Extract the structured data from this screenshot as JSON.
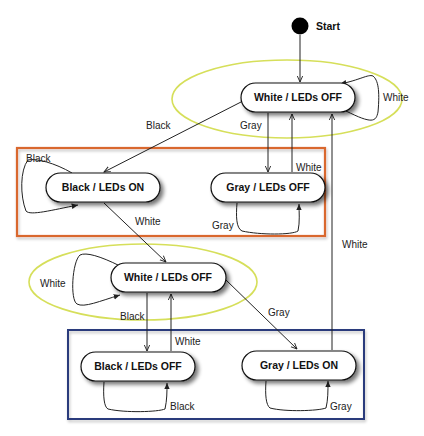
{
  "diagram": {
    "type": "state-machine",
    "start": {
      "label": "Start"
    },
    "groups": {
      "top_ellipse": {
        "color": "#d6df5a"
      },
      "orange_box": {
        "color": "#d9682f"
      },
      "middle_ellipse": {
        "color": "#d6df5a"
      },
      "blue_box": {
        "color": "#2b3a7c"
      }
    },
    "states": [
      {
        "id": "s1",
        "label": "White /  LEDs OFF"
      },
      {
        "id": "s2",
        "label": "Black /  LEDs ON"
      },
      {
        "id": "s3",
        "label": "Gray /  LEDs OFF"
      },
      {
        "id": "s4",
        "label": "White /  LEDs OFF"
      },
      {
        "id": "s5",
        "label": "Black /  LEDs OFF"
      },
      {
        "id": "s6",
        "label": "Gray /  LEDs ON"
      }
    ],
    "transitions": [
      {
        "from": "start",
        "to": "s1",
        "label": ""
      },
      {
        "from": "s1",
        "to": "s1",
        "label": "White"
      },
      {
        "from": "s1",
        "to": "s2",
        "label": "Black"
      },
      {
        "from": "s1",
        "to": "s3",
        "label": "Gray"
      },
      {
        "from": "s3",
        "to": "s1",
        "label": "White"
      },
      {
        "from": "s2",
        "to": "s2",
        "label": "Black"
      },
      {
        "from": "s3",
        "to": "s3",
        "label": "Gray"
      },
      {
        "from": "s2",
        "to": "s4",
        "label": "White"
      },
      {
        "from": "s4",
        "to": "s4",
        "label": "White"
      },
      {
        "from": "s4",
        "to": "s5",
        "label": "Black"
      },
      {
        "from": "s5",
        "to": "s4",
        "label": "White"
      },
      {
        "from": "s4",
        "to": "s6",
        "label": "Gray"
      },
      {
        "from": "s6",
        "to": "s1",
        "label": "White"
      },
      {
        "from": "s5",
        "to": "s5",
        "label": "Black"
      },
      {
        "from": "s6",
        "to": "s6",
        "label": "Gray"
      }
    ]
  }
}
